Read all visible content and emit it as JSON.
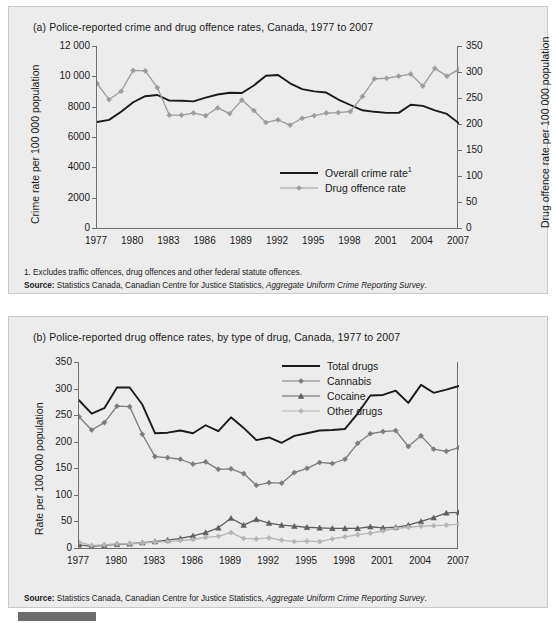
{
  "chart_data": [
    {
      "id": "chart-a",
      "type": "line",
      "title": "(a) Police-reported crime and drug offence rates, Canada, 1977 to 2007",
      "xlabel": "",
      "ylabel": "Crime rate per 100 000 population",
      "y2label": "Drug offence rate per 100 000 population",
      "grid": false,
      "legend_position": "inside-right-lower",
      "xlim": [
        1977,
        2007
      ],
      "ylim": [
        0,
        12000
      ],
      "y2lim": [
        0,
        350
      ],
      "yticks": [
        "0",
        "2000",
        "4000",
        "6000",
        "8000",
        "10 000",
        "12 000"
      ],
      "ytick_values": [
        0,
        2000,
        4000,
        6000,
        8000,
        10000,
        12000
      ],
      "y2ticks": [
        "0",
        "50",
        "100",
        "150",
        "200",
        "250",
        "300",
        "350"
      ],
      "y2tick_values": [
        0,
        50,
        100,
        150,
        200,
        250,
        300,
        350
      ],
      "xticks": [
        "1977",
        "1980",
        "1983",
        "1986",
        "1989",
        "1992",
        "1995",
        "1998",
        "2001",
        "2004",
        "2007"
      ],
      "xtick_values": [
        1977,
        1980,
        1983,
        1986,
        1989,
        1992,
        1995,
        1998,
        2001,
        2004,
        2007
      ],
      "x": [
        1977,
        1978,
        1979,
        1980,
        1981,
        1982,
        1983,
        1984,
        1985,
        1986,
        1987,
        1988,
        1989,
        1990,
        1991,
        1992,
        1993,
        1994,
        1995,
        1996,
        1997,
        1998,
        1999,
        2000,
        2001,
        2002,
        2003,
        2004,
        2005,
        2006,
        2007
      ],
      "series": [
        {
          "name": "Overall crime rate¹",
          "axis": "left",
          "color": "#1a1a1a",
          "marker": "none",
          "values": [
            6985,
            7130,
            7670,
            8290,
            8690,
            8770,
            8400,
            8390,
            8350,
            8600,
            8800,
            8920,
            8900,
            9400,
            10040,
            10090,
            9540,
            9160,
            9010,
            8930,
            8470,
            8110,
            7760,
            7660,
            7590,
            7590,
            8130,
            8050,
            7750,
            7520,
            6900
          ]
        },
        {
          "name": "Drug offence rate",
          "axis": "right",
          "color": "#9c9c9c",
          "marker": "diamond",
          "values": [
            278,
            247,
            263,
            303,
            302,
            270,
            217,
            217,
            221,
            216,
            231,
            220,
            246,
            226,
            203,
            208,
            198,
            211,
            216,
            221,
            222,
            224,
            253,
            287,
            288,
            292,
            296,
            273,
            307,
            292,
            305
          ]
        }
      ],
      "footnote": "1. Excludes traffic offences, drug offences and other federal statute offences.",
      "source_label": "Source:",
      "source_text": "Statistics Canada, Canadian Centre for Justice Statistics, ",
      "source_italic": "Aggregate Uniform Crime Reporting Survey",
      "source_end": "."
    },
    {
      "id": "chart-b",
      "type": "line",
      "title": "(b) Police-reported drug offence rates, by type of drug, Canada, 1977 to 2007",
      "xlabel": "",
      "ylabel": "Rate per 100 000 population",
      "grid": false,
      "legend_position": "top-right",
      "xlim": [
        1977,
        2007
      ],
      "ylim": [
        0,
        350
      ],
      "yticks": [
        "0",
        "50",
        "100",
        "150",
        "200",
        "250",
        "300",
        "350"
      ],
      "ytick_values": [
        0,
        50,
        100,
        150,
        200,
        250,
        300,
        350
      ],
      "xticks": [
        "1977",
        "1980",
        "1983",
        "1986",
        "1989",
        "1992",
        "1995",
        "1998",
        "2001",
        "2004",
        "2007"
      ],
      "xtick_values": [
        1977,
        1980,
        1983,
        1986,
        1989,
        1992,
        1995,
        1998,
        2001,
        2004,
        2007
      ],
      "x": [
        1977,
        1978,
        1979,
        1980,
        1981,
        1982,
        1983,
        1984,
        1985,
        1986,
        1987,
        1988,
        1989,
        1990,
        1991,
        1992,
        1993,
        1994,
        1995,
        1996,
        1997,
        1998,
        1999,
        2000,
        2001,
        2002,
        2003,
        2004,
        2005,
        2006,
        2007
      ],
      "series": [
        {
          "name": "Total drugs",
          "color": "#1a1a1a",
          "marker": "none",
          "values": [
            278,
            253,
            263,
            302,
            302,
            270,
            216,
            217,
            221,
            216,
            231,
            220,
            246,
            226,
            203,
            208,
            198,
            211,
            216,
            221,
            222,
            224,
            253,
            287,
            288,
            296,
            273,
            307,
            292,
            298,
            305
          ]
        },
        {
          "name": "Cannabis",
          "color": "#7c7c7c",
          "marker": "diamond",
          "values": [
            247,
            222,
            236,
            267,
            266,
            214,
            172,
            170,
            167,
            158,
            162,
            148,
            149,
            140,
            118,
            123,
            122,
            142,
            150,
            161,
            159,
            167,
            197,
            215,
            219,
            221,
            191,
            211,
            186,
            182,
            189
          ]
        },
        {
          "name": "Cocaine",
          "color": "#5e5e5e",
          "marker": "triangle",
          "values": [
            6,
            3,
            5,
            7,
            8,
            10,
            12,
            15,
            18,
            23,
            29,
            38,
            56,
            43,
            54,
            47,
            43,
            41,
            39,
            38,
            37,
            37,
            37,
            40,
            38,
            39,
            43,
            50,
            57,
            66,
            67
          ]
        },
        {
          "name": "Other drugs",
          "color": "#b5b5b5",
          "marker": "diamond",
          "values": [
            11,
            5,
            6,
            8,
            8,
            9,
            11,
            12,
            14,
            16,
            20,
            22,
            29,
            18,
            17,
            19,
            15,
            12,
            13,
            12,
            17,
            21,
            25,
            28,
            32,
            37,
            39,
            41,
            42,
            43,
            45
          ]
        }
      ],
      "source_label": "Source:",
      "source_text": "Statistics Canada, Canadian Centre for Justice Statistics, ",
      "source_italic": "Aggregate Uniform Crime Reporting Survey",
      "source_end": "."
    }
  ],
  "panel_a": {
    "title": "(a) Police-reported crime and drug offence rates, Canada, 1977 to 2007",
    "ylabel": "Crime rate per 100 000 population",
    "y2label": "Drug offence rate per 100 000 population",
    "legend": [
      {
        "label": "Overall crime rate",
        "sup": "1",
        "marker": "none",
        "color": "#1a1a1a"
      },
      {
        "label": "Drug offence rate",
        "sup": "",
        "marker": "diamond",
        "color": "#9c9c9c"
      }
    ],
    "footnote": "1. Excludes traffic offences, drug offences and other federal statute offences.",
    "source_label": "Source:",
    "source_text": " Statistics Canada, Canadian Centre for Justice Statistics, ",
    "source_italic": "Aggregate Uniform Crime Reporting Survey",
    "source_end": "."
  },
  "panel_b": {
    "title": "(b) Police-reported drug offence rates, by type of drug, Canada, 1977 to 2007",
    "ylabel": "Rate per 100 000 population",
    "legend": [
      {
        "label": "Total drugs",
        "marker": "none",
        "color": "#1a1a1a"
      },
      {
        "label": "Cannabis",
        "marker": "diamond",
        "color": "#7c7c7c"
      },
      {
        "label": "Cocaine",
        "marker": "triangle",
        "color": "#5e5e5e"
      },
      {
        "label": "Other drugs",
        "marker": "diamond",
        "color": "#b5b5b5"
      }
    ],
    "source_label": "Source:",
    "source_text": " Statistics Canada, Canadian Centre for Justice Statistics, ",
    "source_italic": "Aggregate Uniform Crime Reporting Survey",
    "source_end": "."
  }
}
